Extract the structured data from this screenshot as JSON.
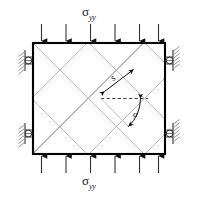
{
  "figure": {
    "type": "engineering-diagram",
    "background_color": "#ffffff",
    "plate": {
      "name": "plate-body",
      "x": 32,
      "y": 42,
      "width": 134,
      "height": 113,
      "border_color": "#000000",
      "border_width": 2,
      "fill_color": "#ffffff"
    },
    "hatch": {
      "name": "internal-diagonal-crack-network",
      "color": "#b8b8b8",
      "line_width": 1,
      "angle_degrees": 45,
      "description": "diamond lattice of +45 and -45 degree lines"
    },
    "load_top": {
      "label": "σ",
      "subscript": "yy",
      "arrow_count": 6,
      "direction": "down",
      "color": "#000000"
    },
    "load_bottom": {
      "label": "σ",
      "subscript": "yy",
      "arrow_count": 6,
      "direction": "up",
      "color": "#000000"
    },
    "supports_left": {
      "name": "roller-supports-left",
      "count": 2,
      "type": "roller",
      "hatch_color": "#808080"
    },
    "supports_right": {
      "name": "roller-supports-right",
      "count": 2,
      "type": "roller",
      "hatch_color": "#808080"
    },
    "annotations": {
      "spacing": {
        "label": "s",
        "description": "double-headed arrow measuring crack band spacing"
      },
      "angle": {
        "label": "α",
        "description": "arc from horizontal dashed reference to inclined crack line"
      },
      "reference_line": {
        "name": "horizontal-dashed-reference",
        "style": "dashed",
        "color": "#222222"
      }
    }
  }
}
